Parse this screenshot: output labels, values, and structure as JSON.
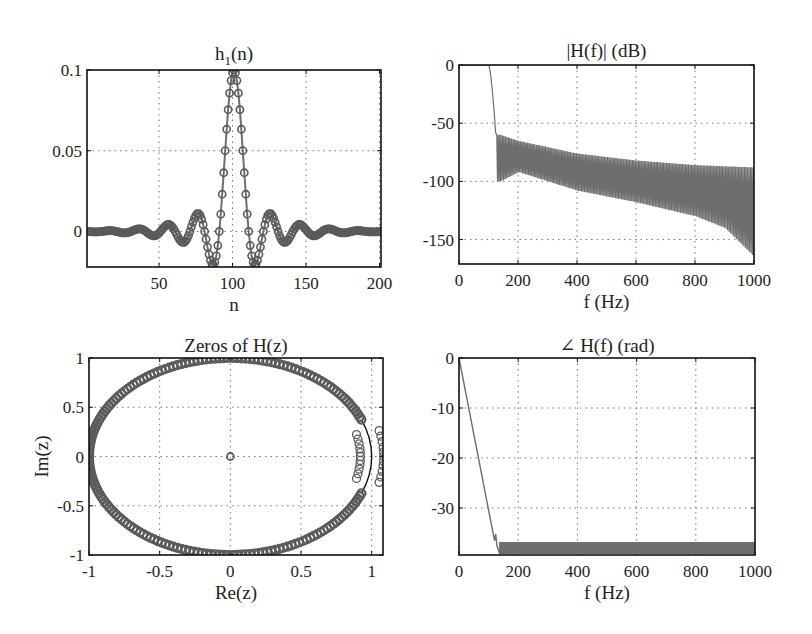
{
  "figure": {
    "width": 812,
    "height": 634,
    "colors": {
      "axes": "#111111",
      "grid": "#777777",
      "series": "#6e6e6e",
      "marker": "#5a5a5a",
      "text": "#222222"
    }
  },
  "chart_data": [
    {
      "id": "impulse",
      "type": "line",
      "title": "h1(n)",
      "title_main": "h",
      "title_sub": "1",
      "title_rest": "(n)",
      "xlabel": "n",
      "ylabel": "",
      "xlim": [
        1,
        201
      ],
      "ylim": [
        -0.022,
        0.1
      ],
      "xticks": [
        50,
        100,
        150,
        200
      ],
      "xtick_labels": [
        "50",
        "100",
        "150",
        "200"
      ],
      "yticks": [
        0,
        0.05,
        0.1
      ],
      "ytick_labels": [
        "0",
        "0.05",
        "0.1"
      ],
      "grid": true,
      "marker": "circle",
      "description": "Windowed-sinc lowpass impulse response, 201 taps, centered at n=101, peak 0.1",
      "series": [
        {
          "name": "h1(n)",
          "model": {
            "center": 101,
            "peak": 0.1,
            "cutoff_norm": 0.1,
            "length": 201
          }
        }
      ],
      "key_points": [
        {
          "n": 1,
          "h": 0
        },
        {
          "n": 68,
          "h": -0.005
        },
        {
          "n": 77,
          "h": 0.011
        },
        {
          "n": 88,
          "h": -0.021
        },
        {
          "n": 101,
          "h": 0.1
        },
        {
          "n": 114,
          "h": -0.021
        },
        {
          "n": 125,
          "h": 0.011
        },
        {
          "n": 134,
          "h": -0.005
        },
        {
          "n": 201,
          "h": 0
        }
      ],
      "box": {
        "left": 87,
        "top": 70,
        "right": 381,
        "bottom": 267
      }
    },
    {
      "id": "magnitude",
      "type": "line",
      "title": "|H(f)| (dB)",
      "xlabel": "f (Hz)",
      "ylabel": "",
      "xlim": [
        0,
        1000
      ],
      "ylim": [
        -171,
        0
      ],
      "xticks": [
        0,
        200,
        400,
        600,
        800,
        1000
      ],
      "xtick_labels": [
        "0",
        "200",
        "400",
        "600",
        "800",
        "1000"
      ],
      "yticks": [
        -150,
        -100,
        -50,
        0
      ],
      "ytick_labels": [
        "-150",
        "-100",
        "-50",
        "0"
      ],
      "grid": true,
      "passband": {
        "f_end": 100,
        "level_db": 0
      },
      "transition": {
        "f_start": 100,
        "f_end": 125,
        "level_end_db": -62
      },
      "stopband_upper_envelope": {
        "x": [
          140,
          200,
          400,
          600,
          800,
          1000
        ],
        "y": [
          -60,
          -65,
          -76,
          -82,
          -86,
          -88
        ]
      },
      "stopband_lower_envelope": {
        "x": [
          140,
          200,
          400,
          600,
          800,
          900,
          1000
        ],
        "y": [
          -100,
          -92,
          -108,
          -118,
          -130,
          -140,
          -165
        ]
      },
      "box": {
        "left": 459,
        "top": 65,
        "right": 754,
        "bottom": 264
      }
    },
    {
      "id": "zeros",
      "type": "scatter",
      "title": "Zeros of H(z)",
      "xlabel": "Re(z)",
      "ylabel": "Im(z)",
      "xlim": [
        -1,
        1.08
      ],
      "ylim": [
        -1,
        1
      ],
      "xticks": [
        -1,
        -0.5,
        0,
        0.5,
        1
      ],
      "xtick_labels": [
        "-1",
        "-0.5",
        "0",
        "0.5",
        "1"
      ],
      "yticks": [
        -1,
        -0.5,
        0,
        0.5,
        1
      ],
      "ytick_labels": [
        "-1",
        "-0.5",
        "0",
        "0.5",
        "1"
      ],
      "grid": true,
      "marker": "circle",
      "unit_circle_zeros": {
        "radius": 1,
        "angle_gap_deg": 22,
        "count_approx": 180
      },
      "inner_zeros": {
        "radius": 0.92,
        "angles_deg": [
          -14,
          -11,
          -8,
          -5,
          -2.5,
          0,
          2.5,
          5,
          8,
          11,
          14
        ]
      },
      "outer_zeros": {
        "radius": 1.085,
        "angles_deg": [
          -14,
          -11,
          -8,
          -5,
          -2.5,
          0,
          2.5,
          5,
          8,
          11,
          14
        ]
      },
      "origin_zero": {
        "re": 0,
        "im": 0
      },
      "box": {
        "left": 89,
        "top": 358,
        "right": 383,
        "bottom": 555
      }
    },
    {
      "id": "phase",
      "type": "line",
      "title": "∠ H(f) (rad)",
      "xlabel": "f (Hz)",
      "ylabel": "",
      "xlim": [
        0,
        1000
      ],
      "ylim": [
        -39.4,
        0
      ],
      "xticks": [
        0,
        200,
        400,
        600,
        800,
        1000
      ],
      "xtick_labels": [
        "0",
        "200",
        "400",
        "600",
        "800",
        "1000"
      ],
      "yticks": [
        -30,
        -20,
        -10,
        0
      ],
      "ytick_labels": [
        "-30",
        "-20",
        "-10",
        "0"
      ],
      "grid": true,
      "linear_phase": {
        "x": [
          0,
          120
        ],
        "y": [
          0,
          -36.5
        ]
      },
      "stopband_band": {
        "f_start": 138,
        "f_end": 1000,
        "y_top": -36.8,
        "y_bottom": -39.2
      },
      "box": {
        "left": 459,
        "top": 358,
        "right": 755,
        "bottom": 555
      }
    }
  ]
}
